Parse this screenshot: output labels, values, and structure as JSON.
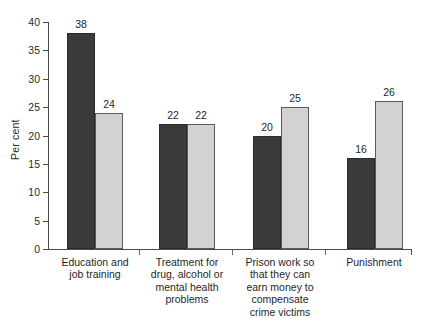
{
  "chart_data": {
    "type": "bar",
    "title": "",
    "subtitle": "",
    "xlabel": "",
    "ylabel": "Per cent",
    "ylim": [
      0,
      40
    ],
    "ytick_step": 5,
    "ytick_labels": [
      "0",
      "5",
      "10",
      "15",
      "20",
      "25",
      "30",
      "35",
      "40"
    ],
    "grid": false,
    "legend": "none",
    "categories": [
      "Education and job training",
      "Treatment for drug, alcohol or mental health problems",
      "Prison work so that they can earn money to compensate crime victims",
      "Punishment"
    ],
    "category_label_lines": [
      [
        "Education and",
        "job training"
      ],
      [
        "Treatment for",
        "drug, alcohol or",
        "mental health",
        "problems"
      ],
      [
        "Prison work so",
        "that they can",
        "earn money to",
        "compensate",
        "crime victims"
      ],
      [
        "Punishment"
      ]
    ],
    "series": [
      {
        "name": "Series 1",
        "color": "#3a3a3a",
        "values": [
          38,
          22,
          20,
          16
        ]
      },
      {
        "name": "Series 2",
        "color": "#d2d2d2",
        "values": [
          24,
          22,
          25,
          26
        ]
      }
    ],
    "value_labels": [
      [
        "38",
        "24"
      ],
      [
        "22",
        "22"
      ],
      [
        "20",
        "25"
      ],
      [
        "16",
        "26"
      ]
    ]
  },
  "axis": {
    "y_label": "Per cent",
    "ticks": [
      "40",
      "35",
      "30",
      "25",
      "20",
      "15",
      "10",
      "5",
      "0"
    ]
  }
}
